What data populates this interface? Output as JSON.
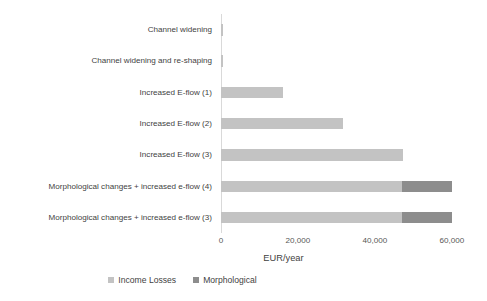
{
  "chart_data": {
    "type": "bar",
    "orientation": "horizontal",
    "stacked": true,
    "title": "",
    "xlabel": "EUR/year",
    "ylabel": "",
    "xlim": [
      0,
      60000
    ],
    "xticks": [
      "0",
      "20,000",
      "40,000",
      "60,000"
    ],
    "xtick_values": [
      0,
      20000,
      40000,
      60000
    ],
    "grid": false,
    "legend_position": "bottom",
    "categories": [
      "Channel widening",
      "Channel widening and re-shaping",
      "Increased E-flow (1)",
      "Increased E-flow (2)",
      "Increased E-flow (3)",
      "Morphological changes  + increased e-flow (4)",
      "Morphological changes + increased e-flow (3)"
    ],
    "series": [
      {
        "name": "Income Losses",
        "color": "#c3c3c3",
        "values": [
          600,
          600,
          16100,
          31700,
          47300,
          47000,
          47000
        ]
      },
      {
        "name": "Morphological",
        "color": "#8d8d8d",
        "values": [
          0,
          0,
          0,
          0,
          0,
          13000,
          13000
        ]
      }
    ]
  },
  "legend": {
    "items": [
      {
        "label": "Income Losses",
        "color": "#c3c3c3"
      },
      {
        "label": "Morphological",
        "color": "#8d8d8d"
      }
    ]
  }
}
